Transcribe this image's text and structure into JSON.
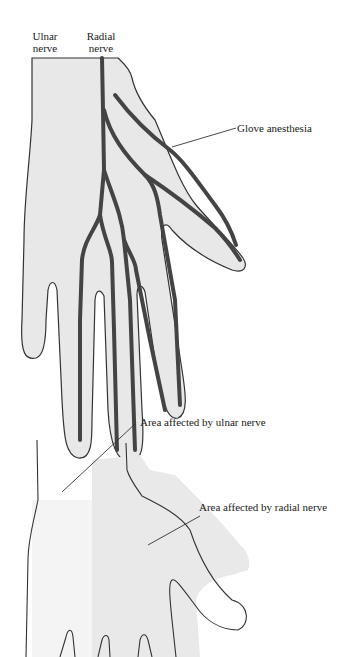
{
  "top_diagram": {
    "labels": {
      "ulnar_line1": "Ulnar",
      "ulnar_line2": "nerve",
      "radial_line1": "Radial",
      "radial_line2": "nerve",
      "glove": "Glove anesthesia"
    }
  },
  "bottom_diagram": {
    "labels": {
      "ulnar_area": "Area affected by ulnar nerve",
      "radial_area": "Area affected by radial nerve"
    }
  },
  "colors": {
    "hand_fill": "#e8e8e8",
    "outline": "#333333",
    "nerve": "#444444",
    "ulnar_area_fill": "#f4f4f4",
    "radial_area_fill": "#e9e9e9"
  }
}
